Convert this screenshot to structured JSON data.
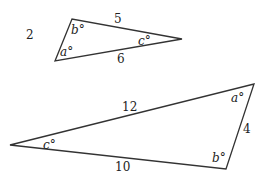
{
  "diagram": {
    "type": "two-triangles",
    "stroke_color": "#333333",
    "triangles": [
      {
        "name": "small-triangle",
        "vertices": {
          "top": [
            72,
            19
          ],
          "left": [
            55,
            61
          ],
          "right": [
            182,
            39
          ]
        },
        "sides": {
          "left_side": "2",
          "top_side": "5",
          "bottom_side": "6"
        },
        "angles": {
          "top": "b°",
          "left": "a°",
          "right": "c°"
        }
      },
      {
        "name": "large-triangle",
        "vertices": {
          "left": [
            10,
            145
          ],
          "top_right": [
            254,
            84
          ],
          "bottom_right": [
            226,
            169
          ]
        },
        "sides": {
          "top_side": "12",
          "right_side": "4",
          "bottom_side": "10"
        },
        "angles": {
          "top_right": "a°",
          "bottom_right": "b°",
          "left": "c°"
        }
      }
    ]
  }
}
